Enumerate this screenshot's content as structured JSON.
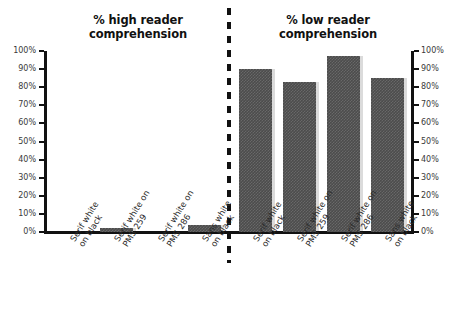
{
  "figure": {
    "background_color": "#ffffff",
    "bar_color": "#4c4c4c",
    "axis_color": "#111111",
    "divider_style": "dashed-vertical"
  },
  "panels": {
    "left": {
      "title_line1": "% high reader",
      "title_line2": "comprehension",
      "axis_side": "left"
    },
    "right": {
      "title_line1": "% low reader",
      "title_line2": "comprehension",
      "axis_side": "right"
    }
  },
  "axis": {
    "ticks": [
      "100%",
      "90%",
      "80%",
      "70%",
      "60%",
      "50%",
      "40%",
      "30%",
      "20%",
      "10%",
      "0%"
    ]
  },
  "categories": [
    {
      "line1": "Serif white",
      "line2": "on black"
    },
    {
      "line1": "Serif white on",
      "line2": "PMS 259"
    },
    {
      "line1": "Serif white on",
      "line2": "PMS 286"
    },
    {
      "line1": "Sans white",
      "line2": "on black"
    }
  ],
  "chart_data": [
    {
      "type": "bar",
      "title": "% high reader comprehension",
      "xlabel": "",
      "ylabel": "",
      "ylim": [
        0,
        100
      ],
      "yticks": [
        0,
        10,
        20,
        30,
        40,
        50,
        60,
        70,
        80,
        90,
        100
      ],
      "ytick_labels": [
        "0%",
        "10%",
        "20%",
        "30%",
        "40%",
        "50%",
        "60%",
        "70%",
        "80%",
        "90%",
        "100%"
      ],
      "grid": false,
      "legend": null,
      "categories": [
        "Serif white on black",
        "Serif white on PMS 259",
        "Serif white on PMS 286",
        "Sans white on black"
      ],
      "values": [
        0,
        2,
        0,
        4
      ]
    },
    {
      "type": "bar",
      "title": "% low reader comprehension",
      "xlabel": "",
      "ylabel": "",
      "ylim": [
        0,
        100
      ],
      "yticks": [
        0,
        10,
        20,
        30,
        40,
        50,
        60,
        70,
        80,
        90,
        100
      ],
      "ytick_labels": [
        "0%",
        "10%",
        "20%",
        "30%",
        "40%",
        "50%",
        "60%",
        "70%",
        "80%",
        "90%",
        "100%"
      ],
      "grid": false,
      "legend": null,
      "categories": [
        "Serif white on black",
        "Serif white on PMS 259",
        "Serif white on PMS 286",
        "Sans white on black"
      ],
      "values": [
        90,
        83,
        97,
        85
      ]
    }
  ]
}
